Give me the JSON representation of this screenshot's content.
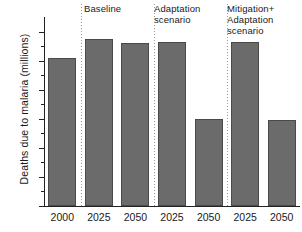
{
  "chart_data": {
    "type": "bar",
    "title": "",
    "xlabel": "",
    "ylabel": "Deaths due to malaria (millions)",
    "ylim": [
      0.0,
      1.3
    ],
    "ytick_values": [
      0.0,
      0.2,
      0.4,
      0.6,
      0.8,
      1.0,
      1.2
    ],
    "ytick_labels": [
      "0.0",
      "0.2",
      "0.4",
      "0.6",
      "0.8",
      "1.0",
      "1.2"
    ],
    "grid": false,
    "legend": "none",
    "bar_color": "#6b6b6b",
    "bar_edge_color": "#4a4a4a",
    "axis_color": "#222222",
    "separator_color": "#9a9a9a",
    "categories": [
      "2000",
      "2025",
      "2050",
      "2025",
      "2050",
      "2025",
      "2050"
    ],
    "values": [
      1.02,
      1.15,
      1.12,
      1.13,
      0.6,
      1.13,
      0.59
    ],
    "group_headers": [
      "Baseline",
      "Adaptation\nscenario",
      "Mitigation+\nAdaptation\nscenario"
    ],
    "group_membership": [
      "reference",
      "Baseline",
      "Baseline",
      "Adaptation scenario",
      "Adaptation scenario",
      "Mitigation+ Adaptation scenario",
      "Mitigation+ Adaptation scenario"
    ],
    "series": [
      {
        "name": "Deaths due to malaria",
        "values": [
          1.02,
          1.15,
          1.12,
          1.13,
          0.6,
          1.13,
          0.59
        ]
      }
    ],
    "annotations": []
  }
}
